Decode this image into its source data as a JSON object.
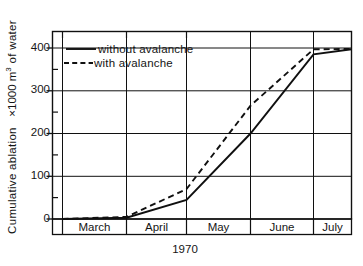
{
  "chart_data": {
    "type": "line",
    "title": "",
    "xlabel": "1970",
    "ylabel": "Cumulative ablation  ×1000 m³ of water",
    "ylabel_parts": {
      "prefix": "Cumulative ablation",
      "multiplier": "×1000 m",
      "exponent": "3",
      "suffix": " of water"
    },
    "ylim": [
      0,
      430
    ],
    "ytick_values": [
      0,
      100,
      200,
      300,
      400
    ],
    "ytick_labels": [
      "0",
      "100",
      "200",
      "300",
      "400"
    ],
    "yminor_values": [
      50,
      150,
      250,
      350
    ],
    "grid": "both",
    "legend_position": "upper-left-inside",
    "x_categories": [
      "March",
      "April",
      "May",
      "June",
      "July"
    ],
    "x_boundaries": [
      "Feb 1",
      "Mar 1",
      "Apr 1",
      "May 1",
      "Jun 1",
      "Jul 1",
      "Aug 1"
    ],
    "series": [
      {
        "name": "without avalanche",
        "style": "solid",
        "color": "#101010",
        "x": [
          "Mar 1",
          "Apr 1",
          "May 1",
          "Jun 1",
          "Jul 1",
          "Aug 1"
        ],
        "values": [
          0,
          3,
          45,
          200,
          385,
          397
        ]
      },
      {
        "name": "with avalanche",
        "style": "dashed",
        "color": "#101010",
        "x": [
          "Mar 1",
          "Apr 1",
          "May 1",
          "Jun 1",
          "Jul 1",
          "Aug 1"
        ],
        "values": [
          0,
          5,
          70,
          265,
          397,
          398
        ]
      }
    ],
    "legend": [
      {
        "label": "without avalanche",
        "style": "solid"
      },
      {
        "label": "with avalanche",
        "style": "dashed"
      }
    ]
  },
  "axis": {
    "ytick_0": "0",
    "ytick_1": "100",
    "ytick_2": "200",
    "ytick_3": "300",
    "ytick_4": "400",
    "month_0": "March",
    "month_1": "April",
    "month_2": "May",
    "month_3": "June",
    "month_4": "July",
    "xlabel": "1970"
  },
  "ylabel": {
    "prefix": "Cumulative ablation",
    "multiplier": "×1000 m",
    "exponent": "3",
    "suffix": "of water"
  },
  "legend": {
    "item_0": "without avalanche",
    "item_1": "with avalanche"
  }
}
